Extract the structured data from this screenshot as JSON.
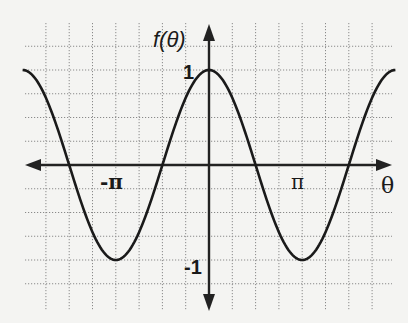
{
  "chart_data": {
    "type": "line",
    "title": "",
    "function": "cos(theta)",
    "xlabel": "θ",
    "ylabel": "f(θ)",
    "x_tick_labels": [
      {
        "label": "-π",
        "value": -3.14159
      },
      {
        "label": "π",
        "value": 3.14159
      }
    ],
    "y_tick_labels": [
      {
        "label": "1",
        "value": 1
      },
      {
        "label": "-1",
        "value": -1
      }
    ],
    "xlim": [
      -6.2832,
      6.2832
    ],
    "ylim": [
      -1.5,
      1.25
    ],
    "grid": true,
    "grid_x_step": 0.7854,
    "grid_y_step": 0.25,
    "series": [
      {
        "name": "f(θ) = cos θ",
        "x": [
          -6.2832,
          -4.7124,
          -3.1416,
          -1.5708,
          0,
          1.5708,
          3.1416,
          4.7124,
          6.2832
        ],
        "values": [
          1,
          0,
          -1,
          0,
          1,
          0,
          -1,
          0,
          1
        ]
      }
    ]
  },
  "labels": {
    "y_axis": "f(θ)",
    "x_axis": "θ",
    "tick_one": "1",
    "tick_neg_one": "-1",
    "tick_pi": "π",
    "tick_neg_pi": "-π"
  },
  "layout": {
    "origin_px": [
      209,
      165
    ],
    "px_per_grid_x": 23.3,
    "px_per_grid_y": 23.75,
    "grid_left": 25,
    "grid_right": 392,
    "grid_top": 23,
    "grid_bottom": 310
  }
}
